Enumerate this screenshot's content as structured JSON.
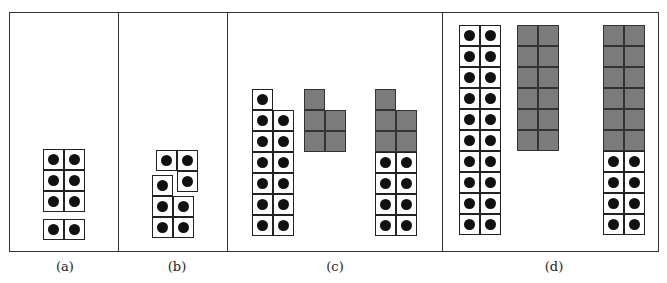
{
  "figure": {
    "panels": [
      {
        "id": "a",
        "label": "(a)",
        "label_x": 65,
        "pieces": [
          {
            "name": "block-3x2",
            "x": 43,
            "y": 149,
            "cells": [
              [
                0,
                0,
                "dot"
              ],
              [
                1,
                0,
                "dot"
              ],
              [
                0,
                1,
                "dot"
              ],
              [
                1,
                1,
                "dot"
              ],
              [
                0,
                2,
                "dot"
              ],
              [
                1,
                2,
                "dot"
              ]
            ]
          },
          {
            "name": "block-1x2",
            "x": 43,
            "y": 219,
            "cells": [
              [
                0,
                0,
                "dot"
              ],
              [
                1,
                0,
                "dot"
              ]
            ]
          }
        ]
      },
      {
        "id": "b",
        "label": "(b)",
        "label_x": 177,
        "pieces": [
          {
            "name": "l-piece-top",
            "x": 156,
            "y": 150,
            "cells": [
              [
                0,
                0,
                "dot"
              ],
              [
                1,
                0,
                "dot"
              ],
              [
                1,
                1,
                "dot"
              ]
            ]
          },
          {
            "name": "l-piece-bottom",
            "x": 152,
            "y": 175,
            "cells": [
              [
                0,
                0,
                "dot"
              ],
              [
                0,
                1,
                "dot"
              ],
              [
                1,
                1,
                "dot"
              ],
              [
                0,
                2,
                "dot"
              ],
              [
                1,
                2,
                "dot"
              ]
            ]
          }
        ]
      },
      {
        "id": "c",
        "label": "(c)",
        "label_x": 335,
        "pieces": [
          {
            "name": "dot-column-13",
            "x": 252,
            "y": 89,
            "cells": [
              [
                0,
                0,
                "dot"
              ],
              [
                0,
                1,
                "dot"
              ],
              [
                1,
                1,
                "dot"
              ],
              [
                0,
                2,
                "dot"
              ],
              [
                1,
                2,
                "dot"
              ],
              [
                0,
                3,
                "dot"
              ],
              [
                1,
                3,
                "dot"
              ],
              [
                0,
                4,
                "dot"
              ],
              [
                1,
                4,
                "dot"
              ],
              [
                0,
                5,
                "dot"
              ],
              [
                1,
                5,
                "dot"
              ],
              [
                0,
                6,
                "dot"
              ],
              [
                1,
                6,
                "dot"
              ]
            ]
          },
          {
            "name": "gray-shape-5",
            "x": 304,
            "y": 89,
            "cells": [
              [
                0,
                0,
                "gray"
              ],
              [
                0,
                1,
                "gray"
              ],
              [
                1,
                1,
                "gray"
              ],
              [
                0,
                2,
                "gray"
              ],
              [
                1,
                2,
                "gray"
              ]
            ]
          },
          {
            "name": "combined-column",
            "x": 375,
            "y": 89,
            "cells": [
              [
                0,
                0,
                "gray"
              ],
              [
                0,
                1,
                "gray"
              ],
              [
                1,
                1,
                "gray"
              ],
              [
                0,
                2,
                "gray"
              ],
              [
                1,
                2,
                "gray"
              ],
              [
                0,
                3,
                "dot"
              ],
              [
                1,
                3,
                "dot"
              ],
              [
                0,
                4,
                "dot"
              ],
              [
                1,
                4,
                "dot"
              ],
              [
                0,
                5,
                "dot"
              ],
              [
                1,
                5,
                "dot"
              ],
              [
                0,
                6,
                "dot"
              ],
              [
                1,
                6,
                "dot"
              ]
            ]
          }
        ]
      },
      {
        "id": "d",
        "label": "(d)",
        "label_x": 554,
        "pieces": [
          {
            "name": "dot-column-20",
            "x": 459,
            "y": 25,
            "cells": [
              [
                0,
                0,
                "dot"
              ],
              [
                1,
                0,
                "dot"
              ],
              [
                0,
                1,
                "dot"
              ],
              [
                1,
                1,
                "dot"
              ],
              [
                0,
                2,
                "dot"
              ],
              [
                1,
                2,
                "dot"
              ],
              [
                0,
                3,
                "dot"
              ],
              [
                1,
                3,
                "dot"
              ],
              [
                0,
                4,
                "dot"
              ],
              [
                1,
                4,
                "dot"
              ],
              [
                0,
                5,
                "dot"
              ],
              [
                1,
                5,
                "dot"
              ],
              [
                0,
                6,
                "dot"
              ],
              [
                1,
                6,
                "dot"
              ],
              [
                0,
                7,
                "dot"
              ],
              [
                1,
                7,
                "dot"
              ],
              [
                0,
                8,
                "dot"
              ],
              [
                1,
                8,
                "dot"
              ],
              [
                0,
                9,
                "dot"
              ],
              [
                1,
                9,
                "dot"
              ]
            ]
          },
          {
            "name": "gray-block-12",
            "x": 517,
            "y": 25,
            "cells": [
              [
                0,
                0,
                "gray"
              ],
              [
                1,
                0,
                "gray"
              ],
              [
                0,
                1,
                "gray"
              ],
              [
                1,
                1,
                "gray"
              ],
              [
                0,
                2,
                "gray"
              ],
              [
                1,
                2,
                "gray"
              ],
              [
                0,
                3,
                "gray"
              ],
              [
                1,
                3,
                "gray"
              ],
              [
                0,
                4,
                "gray"
              ],
              [
                1,
                4,
                "gray"
              ],
              [
                0,
                5,
                "gray"
              ],
              [
                1,
                5,
                "gray"
              ]
            ]
          },
          {
            "name": "combined-column",
            "x": 603,
            "y": 25,
            "cells": [
              [
                0,
                0,
                "gray"
              ],
              [
                1,
                0,
                "gray"
              ],
              [
                0,
                1,
                "gray"
              ],
              [
                1,
                1,
                "gray"
              ],
              [
                0,
                2,
                "gray"
              ],
              [
                1,
                2,
                "gray"
              ],
              [
                0,
                3,
                "gray"
              ],
              [
                1,
                3,
                "gray"
              ],
              [
                0,
                4,
                "gray"
              ],
              [
                1,
                4,
                "gray"
              ],
              [
                0,
                5,
                "gray"
              ],
              [
                1,
                5,
                "gray"
              ],
              [
                0,
                6,
                "dot"
              ],
              [
                1,
                6,
                "dot"
              ],
              [
                0,
                7,
                "dot"
              ],
              [
                1,
                7,
                "dot"
              ],
              [
                0,
                8,
                "dot"
              ],
              [
                1,
                8,
                "dot"
              ],
              [
                0,
                9,
                "dot"
              ],
              [
                1,
                9,
                "dot"
              ]
            ]
          }
        ]
      }
    ],
    "dividers_x": [
      118,
      227,
      442
    ],
    "colors": {
      "gray_tile": "#7b7b7b",
      "dot": "#111111",
      "border": "#222222"
    }
  }
}
